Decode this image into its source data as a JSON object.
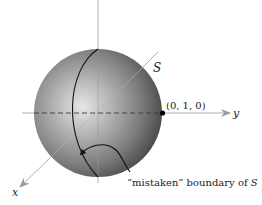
{
  "figure": {
    "labels": {
      "surface": "S",
      "point": "(0, 1, 0)",
      "y_axis": "y",
      "x_axis": "x",
      "caption_prefix": "“mistaken” boundary of ",
      "caption_symbol": "S"
    },
    "colors": {
      "sphere_light": "#e2e2e2",
      "sphere_mid": "#8a8a8a",
      "sphere_dark": "#4a4a4a",
      "axis": "#a8a8a8",
      "curve": "#111111",
      "point": "#000000"
    }
  }
}
